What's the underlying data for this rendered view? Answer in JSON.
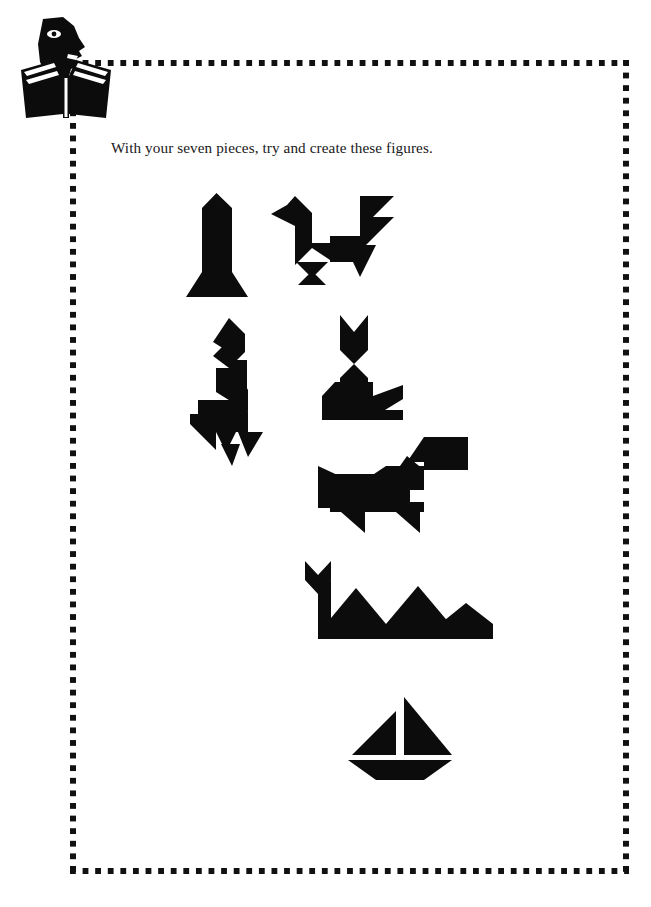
{
  "page": {
    "background_color": "#ffffff",
    "ink_color": "#0d0c0d",
    "width": 651,
    "height": 907
  },
  "logo": {
    "name": "reader-with-open-book",
    "description": "Profile of a face reading an open book",
    "color": "#0d0c0d"
  },
  "border": {
    "style": "dotted-square",
    "dot_size_px": 6,
    "dot_pitch_px": 12.6,
    "color": "#111111",
    "left": 70,
    "top": 60,
    "right": 628,
    "bottom": 874
  },
  "instruction": {
    "text": "With your seven pieces, try and create these figures."
  },
  "figures": [
    {
      "id": "obelisk",
      "label": "Obelisk / column",
      "row": 1,
      "column": 1,
      "bbox": [
        186,
        193,
        62,
        110
      ]
    },
    {
      "id": "rooster",
      "label": "Rooster",
      "row": 1,
      "column": 2,
      "bbox": [
        271,
        196,
        123,
        89
      ]
    },
    {
      "id": "bird",
      "label": "Standing bird",
      "row": 2,
      "column": 1,
      "bbox": [
        190,
        318,
        73,
        148
      ]
    },
    {
      "id": "cat",
      "label": "Cat",
      "row": 2,
      "column": 2,
      "bbox": [
        335,
        315,
        80,
        105
      ]
    },
    {
      "id": "dog",
      "label": "Dog",
      "row": 3,
      "column": 1,
      "bbox": [
        318,
        437,
        150,
        96
      ]
    },
    {
      "id": "crocodile",
      "label": "Crocodile",
      "row": 4,
      "column": 1,
      "bbox": [
        305,
        561,
        188,
        78
      ]
    },
    {
      "id": "sailboat",
      "label": "Sailboat",
      "row": 5,
      "column": 1,
      "bbox": [
        348,
        697,
        104,
        83
      ]
    }
  ]
}
